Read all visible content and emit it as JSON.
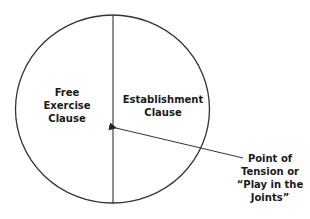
{
  "diagram": {
    "left_region": {
      "lines": [
        "Free",
        "Exercise",
        "Clause"
      ]
    },
    "right_region": {
      "lines": [
        "Establishment",
        "Clause"
      ]
    },
    "annotation": {
      "lines": [
        "Point of",
        "Tension or",
        "“Play in the",
        "Joints”"
      ]
    }
  },
  "colors": {
    "stroke": "#333333",
    "text": "#1a1a1a",
    "background": "#ffffff"
  }
}
